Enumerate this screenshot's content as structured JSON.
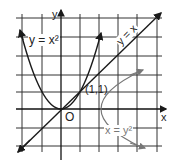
{
  "figure": {
    "axes": {
      "x_label": "x",
      "y_label": "y",
      "origin_label": "O"
    },
    "point_label": "(1,1)",
    "curves": [
      {
        "name": "parabola",
        "label": "y = x²",
        "color": "#1a1a1a"
      },
      {
        "name": "line",
        "label": "y = x",
        "color": "#1a1a1a"
      },
      {
        "name": "sideways-parabola",
        "label": "x = y²",
        "color": "#777777"
      }
    ],
    "grid": {
      "x_range": [
        -2,
        5
      ],
      "y_range": [
        -2,
        5
      ],
      "color": "#333333"
    }
  }
}
